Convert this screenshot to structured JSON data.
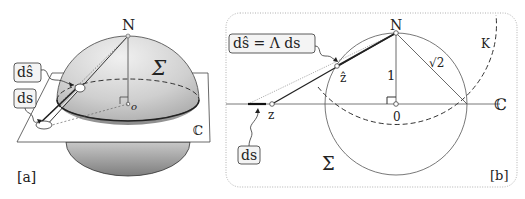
{
  "figure": {
    "panel_a": {
      "tag": "[a]",
      "labels": {
        "north": "N",
        "sphere": "Σ",
        "plane": "ℂ",
        "origin": "o",
        "callout_dshat": "dŝ",
        "callout_ds": "ds"
      }
    },
    "panel_b": {
      "tag": "[b]",
      "labels": {
        "north": "N",
        "circle": "Σ",
        "plane": "ℂ",
        "origin": "0",
        "radius": "1",
        "chord": "√2",
        "circle_k": "K",
        "point_z": "z",
        "point_zhat": "ẑ",
        "callout_top": "dŝ = Λ ds",
        "callout_bottom": "ds"
      }
    },
    "colors": {
      "ink": "#222222",
      "sphere_light": "#e6e6e6",
      "sphere_dark": "#9a9a9a",
      "frame_dotted": "#b0b0b0",
      "callout_fill": "#f4f4f4"
    }
  }
}
